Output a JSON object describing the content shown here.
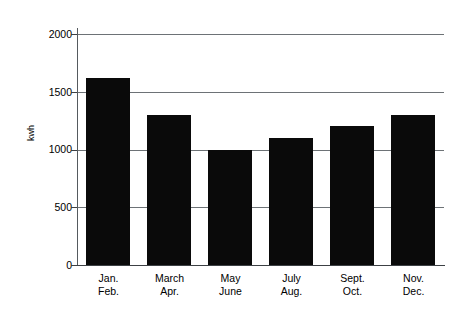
{
  "chart_data": {
    "type": "bar",
    "title": "",
    "subtitle": "",
    "xlabel": "",
    "ylabel": "kwh",
    "categories": [
      "Jan.\nFeb.",
      "March\nApr.",
      "May\nJune",
      "July\nAug.",
      "Sept.\nOct.",
      "Nov.\nDec."
    ],
    "category_lines": [
      [
        "Jan.",
        "Feb."
      ],
      [
        "March",
        "Apr."
      ],
      [
        "May",
        "June"
      ],
      [
        "July",
        "Aug."
      ],
      [
        "Sept.",
        "Oct."
      ],
      [
        "Nov.",
        "Dec."
      ]
    ],
    "values": [
      1620,
      1300,
      1000,
      1100,
      1200,
      1300
    ],
    "ylim": [
      0,
      2000
    ],
    "yticks": [
      0,
      500,
      1000,
      1500,
      2000
    ],
    "ytick_labels": [
      "0",
      "500",
      "1000",
      "1500",
      "2000"
    ],
    "grid": "horizontal",
    "gridlines_at": [
      500,
      1000,
      1500,
      2000
    ],
    "legend": "none",
    "bar_color": "#0a0a0a",
    "axis_color": "#3c4044",
    "grid_color": "#6d7276",
    "background_color": "#ffffff"
  }
}
